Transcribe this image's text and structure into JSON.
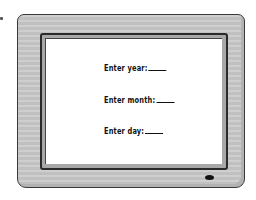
{
  "monitor": {
    "bezel_color": "#c8c8c8",
    "screen_color": "#ffffff",
    "prompts": [
      {
        "label": "Enter year:",
        "value": ""
      },
      {
        "label": "Enter month:",
        "value": ""
      },
      {
        "label": "Enter day:",
        "value": ""
      }
    ],
    "power_indicator": "power-led-icon"
  }
}
